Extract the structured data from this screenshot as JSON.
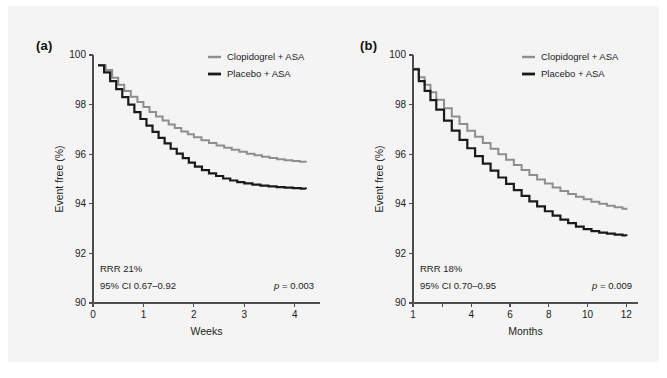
{
  "figure": {
    "background_color": "#f4f4f4",
    "page_color": "#ffffff",
    "series_colors": {
      "clopidogrel": "#8e8e8e",
      "placebo": "#1a1a1a"
    }
  },
  "panels": {
    "a": {
      "letter": "(a)",
      "legend": [
        {
          "label": "Clopidogrel + ASA",
          "color": "#8e8e8e"
        },
        {
          "label": "Placebo + ASA",
          "color": "#1a1a1a"
        }
      ],
      "stats": {
        "rrr": "RRR 21%",
        "ci": "95% CI 0.67–0.92",
        "p_italic": "p",
        "p_rest": " = 0.003"
      }
    },
    "b": {
      "letter": "(b)",
      "legend": [
        {
          "label": "Clopidogrel + ASA",
          "color": "#8e8e8e"
        },
        {
          "label": "Placebo + ASA",
          "color": "#1a1a1a"
        }
      ],
      "stats": {
        "rrr": "RRR 18%",
        "ci": "95% CI 0.70–0.95",
        "p_italic": "p",
        "p_rest": " = 0.009"
      }
    }
  },
  "chart_data": [
    {
      "id": "panel-a",
      "type": "line",
      "title": "(a)",
      "xlabel": "Weeks",
      "ylabel": "Event free (%)",
      "xlim": [
        0,
        4.5
      ],
      "ylim": [
        90,
        100
      ],
      "xticks": [
        0,
        1,
        2,
        3,
        4
      ],
      "xticklabels": [
        "0",
        "1",
        "2",
        "3",
        "4"
      ],
      "yticks": [
        90,
        92,
        94,
        96,
        98,
        100
      ],
      "yticklabels": [
        "90",
        "92",
        "94",
        "96",
        "98",
        "100"
      ],
      "grid": false,
      "legend_position": "top-right",
      "step": true,
      "annotations": [
        "RRR 21%",
        "95% CI 0.67–0.92",
        "p = 0.003"
      ],
      "series": [
        {
          "name": "Clopidogrel + ASA",
          "color": "#8e8e8e",
          "x": [
            0.1,
            0.25,
            0.38,
            0.5,
            0.62,
            0.75,
            0.88,
            1.0,
            1.12,
            1.25,
            1.38,
            1.5,
            1.62,
            1.75,
            1.88,
            2.0,
            2.15,
            2.3,
            2.45,
            2.6,
            2.75,
            2.9,
            3.05,
            3.2,
            3.35,
            3.5,
            3.65,
            3.8,
            3.95,
            4.1,
            4.22
          ],
          "y": [
            99.6,
            99.4,
            99.08,
            98.8,
            98.55,
            98.32,
            98.1,
            97.9,
            97.7,
            97.52,
            97.36,
            97.2,
            97.06,
            96.92,
            96.8,
            96.68,
            96.56,
            96.45,
            96.35,
            96.26,
            96.18,
            96.1,
            96.02,
            95.96,
            95.9,
            95.85,
            95.8,
            95.76,
            95.73,
            95.7,
            95.68
          ]
        },
        {
          "name": "Placebo + ASA",
          "color": "#1a1a1a",
          "x": [
            0.1,
            0.22,
            0.34,
            0.46,
            0.58,
            0.7,
            0.82,
            0.94,
            1.06,
            1.18,
            1.3,
            1.42,
            1.54,
            1.66,
            1.78,
            1.9,
            2.02,
            2.16,
            2.3,
            2.44,
            2.58,
            2.72,
            2.86,
            3.0,
            3.16,
            3.32,
            3.48,
            3.64,
            3.8,
            3.96,
            4.12,
            4.22
          ],
          "y": [
            99.58,
            99.3,
            98.95,
            98.62,
            98.3,
            98.0,
            97.7,
            97.42,
            97.15,
            96.9,
            96.66,
            96.44,
            96.22,
            96.02,
            95.84,
            95.66,
            95.5,
            95.36,
            95.23,
            95.12,
            95.02,
            94.94,
            94.87,
            94.82,
            94.77,
            94.73,
            94.7,
            94.67,
            94.65,
            94.63,
            94.61,
            94.6
          ]
        }
      ]
    },
    {
      "id": "panel-b",
      "type": "line",
      "title": "(b)",
      "xlabel": "Months",
      "ylabel": "Event free (%)",
      "xlim": [
        1,
        12.6
      ],
      "ylim": [
        90,
        100
      ],
      "xticks": [
        1,
        2.5,
        4,
        6,
        8,
        10,
        12
      ],
      "xticklabels": [
        "1",
        "",
        "4",
        "6",
        "8",
        "10",
        "12"
      ],
      "yticks": [
        90,
        92,
        94,
        96,
        98,
        100
      ],
      "yticklabels": [
        "90",
        "92",
        "94",
        "96",
        "98",
        "100"
      ],
      "grid": false,
      "legend_position": "top-right",
      "step": true,
      "annotations": [
        "RRR 18%",
        "95% CI 0.70–0.95",
        "p = 0.009"
      ],
      "series": [
        {
          "name": "Clopidogrel + ASA",
          "color": "#8e8e8e",
          "x": [
            1.0,
            1.3,
            1.6,
            1.9,
            2.2,
            2.6,
            3.0,
            3.4,
            3.8,
            4.2,
            4.6,
            5.0,
            5.4,
            5.8,
            6.2,
            6.6,
            7.0,
            7.4,
            7.8,
            8.2,
            8.6,
            9.0,
            9.4,
            9.8,
            10.2,
            10.6,
            11.0,
            11.4,
            11.8,
            12.0
          ],
          "y": [
            99.45,
            99.1,
            98.8,
            98.5,
            98.2,
            97.85,
            97.52,
            97.22,
            96.95,
            96.7,
            96.45,
            96.22,
            96.0,
            95.78,
            95.56,
            95.36,
            95.16,
            94.98,
            94.82,
            94.66,
            94.52,
            94.4,
            94.28,
            94.18,
            94.08,
            94.0,
            93.92,
            93.86,
            93.8,
            93.75
          ]
        },
        {
          "name": "Placebo + ASA",
          "color": "#1a1a1a",
          "x": [
            1.0,
            1.3,
            1.6,
            1.9,
            2.2,
            2.6,
            3.0,
            3.4,
            3.8,
            4.2,
            4.6,
            5.0,
            5.4,
            5.8,
            6.2,
            6.6,
            7.0,
            7.4,
            7.8,
            8.2,
            8.6,
            9.0,
            9.4,
            9.8,
            10.2,
            10.6,
            11.0,
            11.4,
            11.8,
            12.0
          ],
          "y": [
            99.42,
            98.95,
            98.55,
            98.18,
            97.8,
            97.35,
            96.95,
            96.58,
            96.24,
            95.92,
            95.62,
            95.34,
            95.06,
            94.8,
            94.55,
            94.32,
            94.1,
            93.9,
            93.7,
            93.52,
            93.36,
            93.22,
            93.08,
            92.98,
            92.9,
            92.84,
            92.8,
            92.76,
            92.73,
            92.7
          ]
        }
      ]
    }
  ]
}
